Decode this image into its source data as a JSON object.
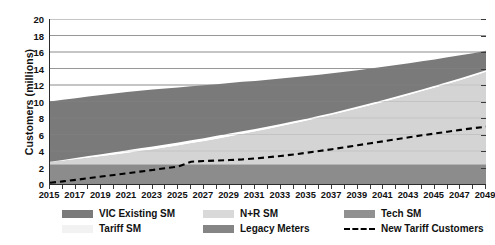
{
  "chart_data": {
    "type": "area",
    "title": "",
    "xlabel": "",
    "ylabel": "Customers (millions)",
    "ylim": [
      0,
      20
    ],
    "ytick_step": 2,
    "yticks": [
      0,
      2,
      4,
      6,
      8,
      10,
      12,
      14,
      16,
      18,
      20
    ],
    "grid": true,
    "grid_axis": "y",
    "legend_position": "bottom",
    "stacked": true,
    "x": [
      2015,
      2016,
      2017,
      2018,
      2019,
      2020,
      2021,
      2022,
      2023,
      2024,
      2025,
      2026,
      2027,
      2028,
      2029,
      2030,
      2031,
      2032,
      2033,
      2034,
      2035,
      2036,
      2037,
      2038,
      2039,
      2040,
      2041,
      2042,
      2043,
      2044,
      2045,
      2046,
      2047,
      2048,
      2049
    ],
    "xticks": [
      2015,
      2017,
      2019,
      2021,
      2023,
      2025,
      2027,
      2029,
      2031,
      2033,
      2035,
      2037,
      2039,
      2041,
      2043,
      2045,
      2047,
      2049
    ],
    "xtick_labels": [
      "2015",
      "2017",
      "2019",
      "2021",
      "2023",
      "2025",
      "2027",
      "2029",
      "2031",
      "2033",
      "2035",
      "2037",
      "2039",
      "2041",
      "2043",
      "2045",
      "2047",
      "2049"
    ],
    "series": [
      {
        "name": "Legacy Meters",
        "kind": "area",
        "color": "#8c8c8c",
        "stack_order": 1,
        "values": [
          2.4,
          2.4,
          2.4,
          2.4,
          2.4,
          2.4,
          2.4,
          2.4,
          2.4,
          2.4,
          2.4,
          2.4,
          2.4,
          2.4,
          2.4,
          2.4,
          2.4,
          2.4,
          2.4,
          2.4,
          2.4,
          2.4,
          2.4,
          2.4,
          2.4,
          2.4,
          2.4,
          2.4,
          2.4,
          2.4,
          2.4,
          2.4,
          2.4,
          2.4,
          2.4
        ]
      },
      {
        "name": "N+R SM",
        "kind": "area",
        "color": "#d4d4d4",
        "stack_order": 2,
        "values": [
          0.3,
          0.46,
          0.62,
          0.8,
          0.98,
          1.18,
          1.38,
          1.6,
          1.82,
          2.06,
          2.3,
          2.56,
          2.82,
          3.1,
          3.38,
          3.68,
          3.98,
          4.3,
          4.62,
          4.96,
          5.3,
          5.66,
          6.02,
          6.4,
          6.78,
          7.18,
          7.58,
          8.0,
          8.42,
          8.86,
          9.3,
          9.76,
          10.22,
          10.7,
          11.2
        ]
      },
      {
        "name": "Tariff SM",
        "kind": "area",
        "color": "#ffffff",
        "stack_order": 3,
        "values": [
          0.0,
          0.06,
          0.12,
          0.18,
          0.22,
          0.26,
          0.3,
          0.32,
          0.34,
          0.34,
          0.34,
          0.34,
          0.34,
          0.34,
          0.34,
          0.32,
          0.3,
          0.28,
          0.26,
          0.24,
          0.22,
          0.2,
          0.2,
          0.2,
          0.2,
          0.2,
          0.2,
          0.2,
          0.2,
          0.2,
          0.2,
          0.2,
          0.2,
          0.2,
          0.2
        ]
      },
      {
        "name": "VIC Existing SM",
        "kind": "area",
        "color": "#7a7a7a",
        "stack_order": 4,
        "values": [
          7.3,
          7.28,
          7.26,
          7.22,
          7.18,
          7.12,
          7.06,
          6.98,
          6.88,
          6.78,
          6.66,
          6.54,
          6.4,
          6.26,
          6.12,
          5.98,
          5.82,
          5.66,
          5.5,
          5.34,
          5.16,
          4.98,
          4.8,
          4.62,
          4.42,
          4.22,
          4.02,
          3.82,
          3.62,
          3.42,
          3.2,
          3.0,
          2.78,
          2.56,
          2.34
        ]
      },
      {
        "name": "Tech SM",
        "kind": "area",
        "color": "#8a8a8a",
        "stack_order": 5,
        "values": [
          0.0,
          0.0,
          0.0,
          0.0,
          0.0,
          0.0,
          0.0,
          0.0,
          0.0,
          0.0,
          0.0,
          0.0,
          0.0,
          0.0,
          0.0,
          0.0,
          0.0,
          0.0,
          0.0,
          0.0,
          0.0,
          0.0,
          0.0,
          0.0,
          0.0,
          0.0,
          0.0,
          0.0,
          0.0,
          0.0,
          0.0,
          0.0,
          0.0,
          0.0,
          0.0
        ]
      },
      {
        "name": "New Tariff Customers",
        "kind": "line",
        "style": "dashed",
        "color": "#000000",
        "values": [
          0.15,
          0.32,
          0.5,
          0.7,
          0.9,
          1.1,
          1.3,
          1.5,
          1.7,
          1.92,
          2.12,
          2.7,
          2.78,
          2.84,
          2.9,
          2.98,
          3.1,
          3.24,
          3.4,
          3.58,
          3.78,
          4.0,
          4.22,
          4.46,
          4.7,
          4.94,
          5.18,
          5.42,
          5.66,
          5.9,
          6.12,
          6.34,
          6.56,
          6.76,
          6.95
        ]
      }
    ],
    "stack_totals": [
      10.0,
      10.2,
      10.4,
      10.6,
      10.78,
      10.96,
      11.14,
      11.3,
      11.44,
      11.58,
      11.7,
      11.84,
      11.96,
      12.1,
      12.24,
      12.38,
      12.5,
      12.64,
      12.78,
      12.94,
      13.08,
      13.24,
      13.42,
      13.62,
      13.8,
      14.0,
      14.2,
      14.42,
      14.64,
      14.88,
      15.1,
      15.36,
      15.6,
      15.86,
      16.14
    ]
  },
  "legend": {
    "items": [
      {
        "label": "VIC Existing SM",
        "color": "#7a7a7a",
        "marker": "swatch"
      },
      {
        "label": "N+R SM",
        "color": "#d9d9d9",
        "marker": "swatch"
      },
      {
        "label": "Tech SM",
        "color": "#909090",
        "marker": "swatch"
      },
      {
        "label": "Tariff SM",
        "color": "#f2f2f2",
        "marker": "swatch"
      },
      {
        "label": "Legacy Meters",
        "color": "#858585",
        "marker": "swatch"
      },
      {
        "label": "New Tariff Customers",
        "color": "#000000",
        "marker": "dashed-line"
      }
    ]
  },
  "colors": {
    "axis": "#2b2b2b",
    "grid": "#8f8f8f",
    "text": "#111111",
    "background": "#ffffff"
  }
}
